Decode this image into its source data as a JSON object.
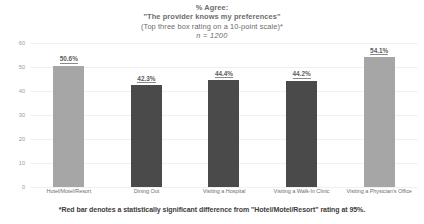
{
  "chart_data": {
    "type": "bar",
    "title": "% Agree:",
    "title_lines": [
      "% Agree:",
      "\"The provider knows my preferences\"",
      "(Top three box rating on a 10-point scale)*",
      "n = 1200"
    ],
    "subtitle": "\"The provider knows my preferences\"",
    "scale_note": "(Top three box rating on a 10-point scale)*",
    "sample_size_label": "n = 1200",
    "categories": [
      "Hotel/Motel/Resort",
      "Dining Out",
      "Visiting a Hospital",
      "Visiting a Walk-In Clinic",
      "Visiting a Physician's Office"
    ],
    "values": [
      50.6,
      42.3,
      44.4,
      44.2,
      54.1
    ],
    "value_labels": [
      "50.6%",
      "42.3%",
      "44.4%",
      "44.2%",
      "54.1%"
    ],
    "bar_colors": [
      "#a6a6a6",
      "#4a4a4a",
      "#4a4a4a",
      "#4a4a4a",
      "#a6a6a6"
    ],
    "significant_flags": [
      false,
      true,
      true,
      true,
      false
    ],
    "xlabel": "",
    "ylabel": "",
    "ylim": [
      0,
      60
    ],
    "yticks": [
      60,
      50,
      40,
      30,
      20,
      10,
      0
    ],
    "ytick_labels": [
      "60",
      "50",
      "40",
      "30",
      "20",
      "10",
      "0"
    ],
    "grid": true,
    "grid_axis": "y",
    "legend": false,
    "legend_position": "none",
    "annotation": "*Red bar denotes a statistically significant difference from \"Hotel/Motel/Resort\" rating at 95%.",
    "colors": {
      "bar_light": "#a6a6a6",
      "bar_dark": "#4a4a4a",
      "gridline": "#f0f0f0",
      "text": "#595959",
      "background": "#ffffff"
    }
  },
  "footnote": {
    "text": "*Red bar denotes a statistically significant difference from \"Hotel/Motel/Resort\" rating at 95%."
  }
}
